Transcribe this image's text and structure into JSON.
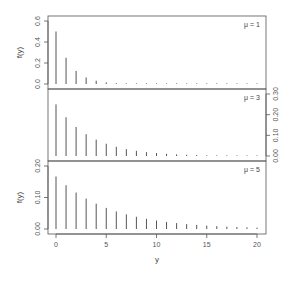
{
  "chart_data": {
    "type": "bar",
    "layout": "three stacked panels sharing x-axis",
    "xlabel": "y",
    "x": [
      0,
      1,
      2,
      3,
      4,
      5,
      6,
      7,
      8,
      9,
      10,
      11,
      12,
      13,
      14,
      15,
      16,
      17,
      18,
      19,
      20
    ],
    "x_ticks": [
      0,
      5,
      10,
      15,
      20
    ],
    "x_range": [
      0,
      20
    ],
    "grid": false,
    "panels": [
      {
        "label": "μ = 1",
        "ylabel": "f(y)",
        "y_axis_side": "left",
        "y_ticks": [
          "0.0",
          "0.2",
          "0.4",
          "0.6"
        ],
        "ylim": [
          0,
          0.6
        ],
        "values": [
          0.5,
          0.25,
          0.125,
          0.0625,
          0.0313,
          0.0156,
          0.0078,
          0.0039,
          0.002,
          0.001,
          0.0005,
          0.0002,
          0.0001,
          0.0001,
          0,
          0,
          0,
          0,
          0,
          0,
          0
        ]
      },
      {
        "label": "μ = 3",
        "ylabel": "f(y)",
        "y_axis_side": "right",
        "y_ticks": [
          "0.00",
          "0.10",
          "0.20",
          "0.30"
        ],
        "ylim": [
          0,
          0.3
        ],
        "values": [
          0.25,
          0.1875,
          0.1406,
          0.1055,
          0.0791,
          0.0593,
          0.0445,
          0.0334,
          0.025,
          0.0188,
          0.0141,
          0.0106,
          0.0079,
          0.0059,
          0.0045,
          0.0033,
          0.0025,
          0.0019,
          0.0014,
          0.0011,
          0.0008
        ]
      },
      {
        "label": "μ = 5",
        "ylabel": "f(y)",
        "y_axis_side": "left",
        "y_ticks": [
          "0.00",
          "0.10",
          "0.20"
        ],
        "ylim": [
          0,
          0.2
        ],
        "values": [
          0.1667,
          0.1389,
          0.1157,
          0.0965,
          0.0804,
          0.067,
          0.0558,
          0.0465,
          0.0388,
          0.0323,
          0.0269,
          0.0224,
          0.0187,
          0.0156,
          0.013,
          0.0108,
          0.009,
          0.0075,
          0.0063,
          0.0052,
          0.0043
        ]
      }
    ]
  },
  "colors": {
    "bar": "#555555",
    "frame": "#555555",
    "text": "#444444"
  }
}
